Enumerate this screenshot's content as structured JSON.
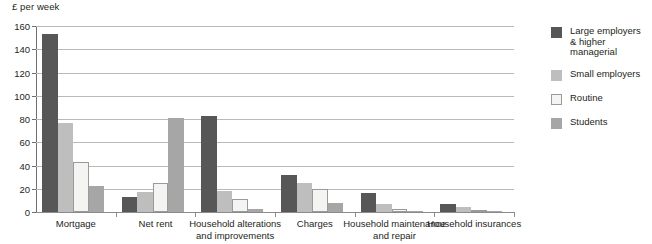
{
  "chart_data": {
    "type": "bar",
    "title": "",
    "subtitle": "",
    "xlabel": "",
    "ylabel": "£ per week",
    "unit_caption": "£ per week",
    "ylim": [
      0,
      160
    ],
    "ytick_step": 20,
    "yticks": [
      0,
      20,
      40,
      60,
      80,
      100,
      120,
      140,
      160
    ],
    "ytick_labels": [
      "0",
      "20",
      "40",
      "60",
      "80",
      "100",
      "120",
      "140",
      "160"
    ],
    "grid": true,
    "legend_position": "right",
    "categories": [
      "Mortgage",
      "Net rent",
      "Household alterations\nand improvements",
      "Charges",
      "Household maintenance\nand repair",
      "Household insurances"
    ],
    "category_lines": [
      [
        "Mortgage"
      ],
      [
        "Net rent"
      ],
      [
        "Household alterations",
        "and improvements"
      ],
      [
        "Charges"
      ],
      [
        "Household maintenance",
        "and repair"
      ],
      [
        "Household insurances"
      ]
    ],
    "series": [
      {
        "name": "Large employers\n& higher managerial",
        "name_lines": [
          "Large employers",
          "& higher managerial"
        ],
        "color": "#575757",
        "values": [
          153,
          13,
          83,
          32,
          16,
          7
        ]
      },
      {
        "name": "Small employers",
        "name_lines": [
          "Small employers"
        ],
        "color": "#bebebe",
        "values": [
          77,
          17,
          18,
          25,
          7,
          4
        ]
      },
      {
        "name": "Routine",
        "name_lines": [
          "Routine"
        ],
        "color": "#f4f4f2",
        "values": [
          43,
          25,
          11,
          20,
          3,
          2
        ]
      },
      {
        "name": "Students",
        "name_lines": [
          "Students"
        ],
        "color": "#a6a6a6",
        "values": [
          22,
          81,
          3,
          8,
          1,
          1
        ]
      }
    ]
  }
}
